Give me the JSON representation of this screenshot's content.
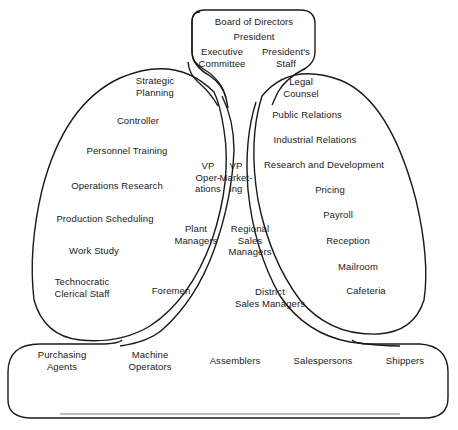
{
  "diagram": {
    "type": "organizational structure diagram",
    "strategic_apex": {
      "labels": [
        "Board of Directors",
        "President",
        "Executive\nCommittee",
        "President's\nStaff"
      ]
    },
    "technostructure": {
      "labels": [
        "Strategic\nPlanning",
        "Controller",
        "Personnel Training",
        "Operations Research",
        "Production Scheduling",
        "Work Study",
        "Technocratic\nClerical Staff"
      ]
    },
    "middle_line": {
      "labels": [
        "VP\nOper-\nations",
        "VP\nMarket-\ning",
        "Plant\nManagers",
        "Regional\nSales\nManagers",
        "Foremen",
        "District\nSales Managers"
      ]
    },
    "support_staff": {
      "labels": [
        "Legal\nCounsel",
        "Public Relations",
        "Industrial Relations",
        "Research and Development",
        "Pricing",
        "Payroll",
        "Reception",
        "Mailroom",
        "Cafeteria"
      ]
    },
    "operating_core": {
      "labels": [
        "Purchasing\nAgents",
        "Machine\nOperators",
        "Assemblers",
        "Salespersons",
        "Shippers"
      ]
    }
  }
}
